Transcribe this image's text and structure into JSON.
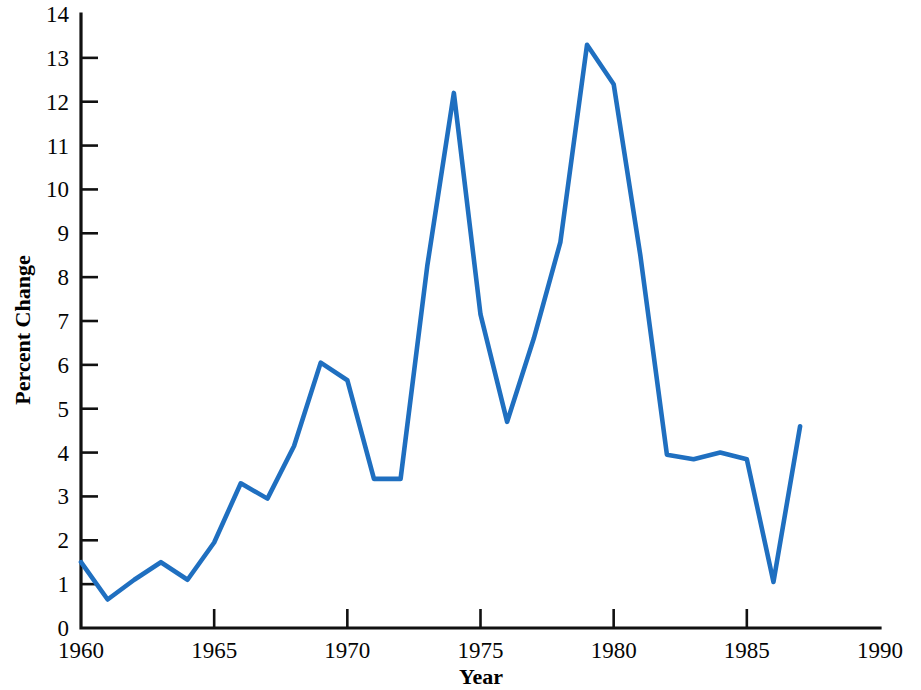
{
  "chart_data": {
    "type": "line",
    "title": "",
    "xlabel": "Year",
    "ylabel": "Percent Change",
    "xlim": [
      1960,
      1990
    ],
    "ylim": [
      0,
      14
    ],
    "grid": false,
    "legend": "none",
    "line_color": "#1f6fc0",
    "axis_color": "#111111",
    "x": [
      1960,
      1961,
      1962,
      1963,
      1964,
      1965,
      1966,
      1967,
      1968,
      1969,
      1970,
      1971,
      1972,
      1973,
      1974,
      1975,
      1976,
      1977,
      1978,
      1979,
      1980,
      1981,
      1982,
      1983,
      1984,
      1985,
      1986,
      1987
    ],
    "values": [
      1.5,
      0.65,
      1.1,
      1.5,
      1.1,
      1.95,
      3.3,
      2.95,
      4.15,
      6.05,
      5.65,
      3.4,
      3.4,
      8.25,
      12.2,
      7.15,
      4.7,
      6.6,
      8.8,
      13.3,
      12.4,
      8.5,
      3.95,
      3.85,
      4.0,
      3.85,
      1.05,
      4.6
    ],
    "series": [
      {
        "name": "Percent Change",
        "color": "#1f6fc0",
        "values": [
          1.5,
          0.65,
          1.1,
          1.5,
          1.1,
          1.95,
          3.3,
          2.95,
          4.15,
          6.05,
          5.65,
          3.4,
          3.4,
          8.25,
          12.2,
          7.15,
          4.7,
          6.6,
          8.8,
          13.3,
          12.4,
          8.5,
          3.95,
          3.85,
          4.0,
          3.85,
          1.05,
          4.6
        ]
      }
    ],
    "x_ticks": [
      1960,
      1965,
      1970,
      1975,
      1980,
      1985,
      1990
    ],
    "x_tick_labels": [
      "1960",
      "1965",
      "1970",
      "1975",
      "1980",
      "1985",
      "1990"
    ],
    "y_ticks": [
      0,
      1,
      2,
      3,
      4,
      5,
      6,
      7,
      8,
      9,
      10,
      11,
      12,
      13,
      14
    ],
    "y_tick_labels": [
      "0",
      "1",
      "2",
      "3",
      "4",
      "5",
      "6",
      "7",
      "8",
      "9",
      "10",
      "11",
      "12",
      "13",
      "14"
    ]
  }
}
